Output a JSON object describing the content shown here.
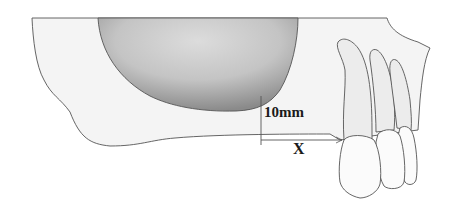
{
  "diagram": {
    "type": "anatomical-illustration",
    "labels": {
      "vertical_measure": "10mm",
      "horizontal_measure": "X"
    },
    "colors": {
      "outline": "#555555",
      "bone_fill": "#f4f4f4",
      "tooth_fill": "#ececec",
      "crown_fill": "#fbfbfb",
      "sinus_dark": "#8d8d8d",
      "sinus_light": "#d9d9d9",
      "text": "#1a1a1a"
    }
  }
}
